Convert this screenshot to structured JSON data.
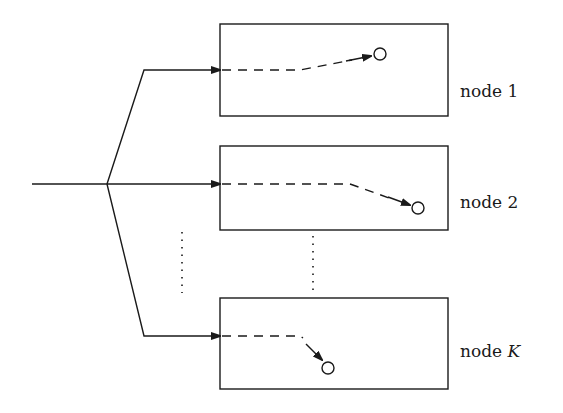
{
  "diagram": {
    "type": "block-diagram",
    "colors": {
      "stroke": "#1a1a1a",
      "background": "#ffffff"
    },
    "input": {
      "x1": 32,
      "y": 184,
      "junction_x": 107
    },
    "nodes": [
      {
        "id": "node-1",
        "label_prefix": "node",
        "label_index": "1",
        "italic_index": false,
        "box": {
          "x": 220,
          "y": 24,
          "w": 228,
          "h": 92
        },
        "branch_y": 70,
        "corner_x": 144,
        "dash_path": "M222 70 L285 70 L300 69 L352 58",
        "arrow_tip": [
          372,
          55
        ],
        "circle": [
          380,
          54
        ]
      },
      {
        "id": "node-2",
        "label_prefix": "node",
        "label_index": "2",
        "italic_index": false,
        "box": {
          "x": 220,
          "y": 146,
          "w": 228,
          "h": 84
        },
        "branch_y": 184,
        "corner_x": 107,
        "dash_path": "M222 184 L348 184 L390 198",
        "arrow_tip": [
          410,
          206
        ],
        "circle": [
          418,
          208
        ]
      },
      {
        "id": "node-k",
        "label_prefix": "node",
        "label_index": "K",
        "italic_index": true,
        "box": {
          "x": 220,
          "y": 298,
          "w": 228,
          "h": 91
        },
        "branch_y": 336,
        "corner_x": 144,
        "dash_path": "M222 336 L300 336 L304 338",
        "arrow_tip": [
          322,
          359
        ],
        "circle": [
          328,
          368
        ]
      }
    ],
    "ellipsis": [
      {
        "x": 182,
        "y1": 232,
        "y2": 293
      },
      {
        "x": 313,
        "y1": 236,
        "y2": 290
      }
    ]
  },
  "labels": {
    "node1": {
      "prefix": "node",
      "index": "1"
    },
    "node2": {
      "prefix": "node",
      "index": "2"
    },
    "nodeK": {
      "prefix": "node",
      "index": "K"
    }
  }
}
